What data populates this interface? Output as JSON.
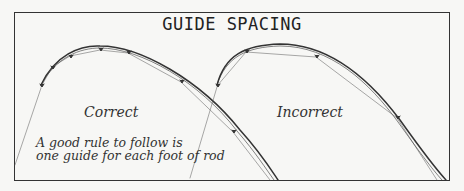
{
  "title": "GUIDE SPACING",
  "labels": {
    "correct": "Correct",
    "incorrect": "Incorrect",
    "rule_line1": "A good rule to follow is",
    "rule_line2": "one guide for each foot of rod"
  },
  "signature": "",
  "colors": {
    "line": "#333333",
    "background": "#f7f7f5"
  },
  "diagrams": [
    {
      "name": "correct",
      "guide_count": 6
    },
    {
      "name": "incorrect",
      "guide_count": 4
    }
  ]
}
